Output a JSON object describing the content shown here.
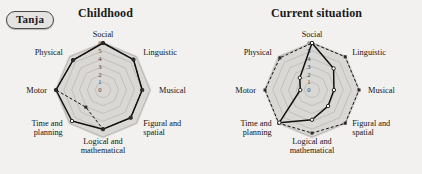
{
  "badge": {
    "label": "Tanja"
  },
  "panels": [
    {
      "title": "Childhood"
    },
    {
      "title": "Current situation"
    }
  ],
  "chart_data": [
    {
      "type": "radar",
      "title": "Childhood",
      "categories": [
        "Social",
        "Linguistic",
        "Musical",
        "Figural and spatial",
        "Logical and mathematical",
        "Time and planning",
        "Motor",
        "Physical"
      ],
      "tick_labels": [
        "0",
        "1",
        "2",
        "3",
        "4",
        "5",
        "6"
      ],
      "rlim": [
        0,
        6
      ],
      "grid": true,
      "legend": "none",
      "series": [
        {
          "name": "solid",
          "style": "solid",
          "values": [
            6,
            5.5,
            5,
            5,
            5,
            5.6,
            6,
            5.4
          ]
        },
        {
          "name": "dashed",
          "style": "dashed",
          "values": [
            6,
            5.5,
            5,
            5,
            5,
            3.1,
            6,
            5.4
          ]
        }
      ]
    },
    {
      "type": "radar",
      "title": "Current situation",
      "categories": [
        "Social",
        "Linguistic",
        "Musical",
        "Figural and spatial",
        "Logical and mathematical",
        "Time and planning",
        "Motor",
        "Physical"
      ],
      "tick_labels": [
        "0",
        "1",
        "2",
        "3",
        "4",
        "5",
        "6"
      ],
      "rlim": [
        0,
        6
      ],
      "grid": true,
      "legend": "none",
      "series": [
        {
          "name": "dashed",
          "style": "dashed",
          "values": [
            6,
            6,
            6,
            6,
            5.5,
            6,
            6,
            5.8
          ]
        },
        {
          "name": "solid",
          "style": "solid",
          "values": [
            6,
            3.9,
            2.8,
            2.9,
            3.8,
            5.9,
            1.5,
            2.2
          ]
        }
      ]
    }
  ],
  "colors": {
    "fill": "#d9d8d5",
    "grid": "#b3b1ad",
    "line": "#111111",
    "background": "#f2f1ef"
  }
}
